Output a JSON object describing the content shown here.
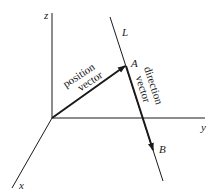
{
  "diagram": {
    "axes": {
      "x": {
        "label": "x"
      },
      "y": {
        "label": "y"
      },
      "z": {
        "label": "z"
      }
    },
    "line": {
      "label": "L"
    },
    "points": {
      "A": {
        "label": "A"
      },
      "B": {
        "label": "B"
      }
    },
    "vectors": {
      "position": {
        "line1": "position",
        "line2": "vector"
      },
      "direction": {
        "line1": "direction",
        "line2": "vector"
      }
    },
    "colors": {
      "ink": "#1a1a1a",
      "background": "#ffffff"
    }
  }
}
